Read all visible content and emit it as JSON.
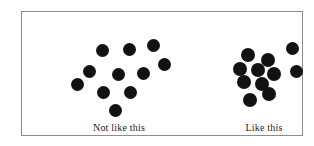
{
  "figure": {
    "type": "conceptual-scatter-comparison",
    "background_color": "#ffffff",
    "border_color": "#8c8c8c",
    "dot_color": "#121212",
    "label_color": "#1a1a1a",
    "dot_diameter_px": 13
  },
  "clusters": [
    {
      "id": "not-like-this",
      "label": "Not like this",
      "label_left_px": 55,
      "label_top_px": 110,
      "label_width_px": 84,
      "pattern": "dispersed",
      "dot_count": 11,
      "dots": [
        {
          "cx": 80,
          "cy": 38,
          "d": 13
        },
        {
          "cx": 107,
          "cy": 37,
          "d": 13
        },
        {
          "cx": 131,
          "cy": 33,
          "d": 13
        },
        {
          "cx": 67,
          "cy": 59,
          "d": 13
        },
        {
          "cx": 96,
          "cy": 62,
          "d": 13
        },
        {
          "cx": 121,
          "cy": 61,
          "d": 13
        },
        {
          "cx": 55,
          "cy": 72,
          "d": 13
        },
        {
          "cx": 81,
          "cy": 80,
          "d": 13
        },
        {
          "cx": 108,
          "cy": 80,
          "d": 13
        },
        {
          "cx": 93,
          "cy": 98,
          "d": 13
        },
        {
          "cx": 142,
          "cy": 52,
          "d": 13
        }
      ]
    },
    {
      "id": "like-this",
      "label": "Like this",
      "label_left_px": 205,
      "label_top_px": 110,
      "label_width_px": 74,
      "pattern": "clumped",
      "dot_count": 11,
      "dots": [
        {
          "cx": 226,
          "cy": 43,
          "d": 14
        },
        {
          "cx": 246,
          "cy": 48,
          "d": 14
        },
        {
          "cx": 218,
          "cy": 57,
          "d": 14
        },
        {
          "cx": 236,
          "cy": 58,
          "d": 14
        },
        {
          "cx": 252,
          "cy": 62,
          "d": 14
        },
        {
          "cx": 222,
          "cy": 70,
          "d": 14
        },
        {
          "cx": 240,
          "cy": 72,
          "d": 14
        },
        {
          "cx": 247,
          "cy": 82,
          "d": 14
        },
        {
          "cx": 228,
          "cy": 88,
          "d": 14
        },
        {
          "cx": 270,
          "cy": 36,
          "d": 13
        },
        {
          "cx": 274,
          "cy": 59,
          "d": 13
        }
      ]
    }
  ]
}
